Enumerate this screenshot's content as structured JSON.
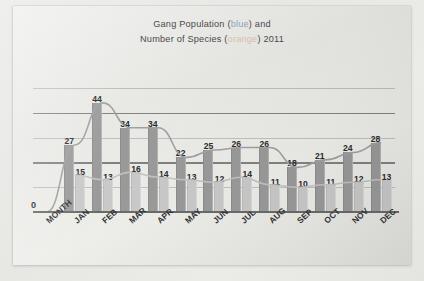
{
  "title": {
    "line1_pre": "Gang Population (",
    "line1_colored": "blue",
    "line1_post": ") and",
    "line2_pre": "Number of Species (",
    "line2_colored": "orange",
    "line2_post": ") 2011",
    "blue_color": "#8fa7c4",
    "orange_color": "#dcc4ab"
  },
  "chart_data": {
    "type": "bar",
    "title": "Gang Population (blue) and Number of Species (orange) 2011",
    "xlabel": "",
    "ylabel": "",
    "ylim": [
      0,
      50
    ],
    "grid": true,
    "legend": "none",
    "categories": [
      "MONTH",
      "JAN",
      "FEB",
      "MAR",
      "APR",
      "MAY",
      "JUN",
      "JUL",
      "AUG",
      "SEP",
      "OCT",
      "NOV",
      "DEC"
    ],
    "series": [
      {
        "name": "Gang Population",
        "color": "#9a9a9a",
        "values": [
          0,
          27,
          44,
          34,
          34,
          22,
          25,
          26,
          26,
          18,
          21,
          24,
          28
        ]
      },
      {
        "name": "Number of Species",
        "color": "#c9c9c9",
        "values": [
          null,
          15,
          13,
          16,
          14,
          13,
          12,
          14,
          11,
          10,
          11,
          12,
          13
        ]
      }
    ],
    "gridline_values": [
      50,
      40,
      30,
      20,
      10,
      0
    ]
  }
}
